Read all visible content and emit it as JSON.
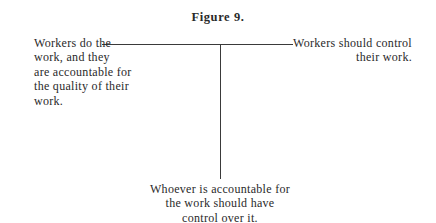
{
  "figure": {
    "title": "Figure 9."
  },
  "nodes": {
    "left": "Workers do the work, and they are accountable for the quality of their work.",
    "left_lines": [
      "Workers do the",
      "work, and they",
      "are accountable for",
      "the quality of their",
      "work."
    ],
    "right_lines": [
      "Workers should control",
      "their work."
    ],
    "bottom_lines": [
      "Whoever is accountable for",
      "the work should have",
      "control over it."
    ]
  },
  "colors": {
    "text": "#2a2a2a",
    "line": "#3a3a3a",
    "background": "#ffffff"
  }
}
